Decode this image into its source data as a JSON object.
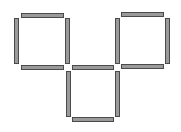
{
  "diagram": {
    "type": "matchstick-puzzle",
    "colors": {
      "stick_fill": "#9a9a9a",
      "stick_outline": "#4a4a4a",
      "background": "#ffffff"
    },
    "stick_count": 12,
    "sticks": [
      {
        "id": "s1",
        "orientation": "horizontal",
        "x": 21,
        "y": 13,
        "w": 43,
        "h": 5
      },
      {
        "id": "s2",
        "orientation": "vertical",
        "x": 14,
        "y": 18,
        "w": 5,
        "h": 46
      },
      {
        "id": "s3",
        "orientation": "vertical",
        "x": 65,
        "y": 18,
        "w": 5,
        "h": 46
      },
      {
        "id": "s4",
        "orientation": "horizontal",
        "x": 21,
        "y": 65,
        "w": 43,
        "h": 5
      },
      {
        "id": "s5",
        "orientation": "horizontal",
        "x": 121,
        "y": 12,
        "w": 43,
        "h": 5
      },
      {
        "id": "s6",
        "orientation": "vertical",
        "x": 115,
        "y": 18,
        "w": 5,
        "h": 46
      },
      {
        "id": "s7",
        "orientation": "vertical",
        "x": 165,
        "y": 18,
        "w": 5,
        "h": 46
      },
      {
        "id": "s8",
        "orientation": "horizontal",
        "x": 121,
        "y": 64,
        "w": 43,
        "h": 5
      },
      {
        "id": "s9",
        "orientation": "horizontal",
        "x": 72,
        "y": 65,
        "w": 42,
        "h": 5
      },
      {
        "id": "s10",
        "orientation": "vertical",
        "x": 66,
        "y": 71,
        "w": 5,
        "h": 46
      },
      {
        "id": "s11",
        "orientation": "vertical",
        "x": 115,
        "y": 71,
        "w": 5,
        "h": 46
      },
      {
        "id": "s12",
        "orientation": "horizontal",
        "x": 72,
        "y": 117,
        "w": 42,
        "h": 5
      }
    ]
  }
}
